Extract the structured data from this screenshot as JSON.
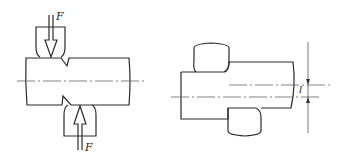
{
  "figure": {
    "left_panel": {
      "description": "Shaft with V-notches compressed by two opposing tools",
      "force_top_label": "F",
      "force_bottom_label": "F"
    },
    "right_panel": {
      "description": "Stepped shaft between offset rolls with eccentricity dimension",
      "dimension_label": "l"
    }
  },
  "colors": {
    "line": "#2a2a2a",
    "background": "#ffffff"
  }
}
